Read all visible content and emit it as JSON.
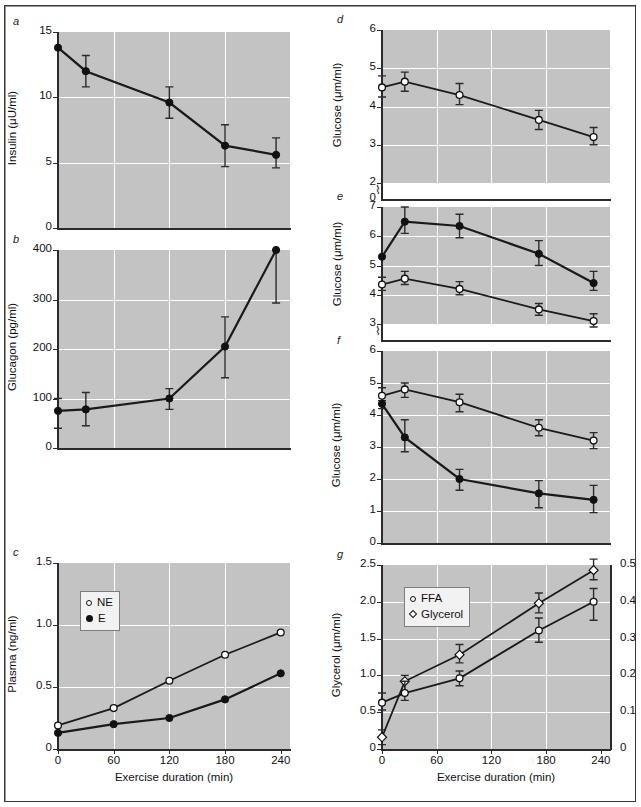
{
  "figure": {
    "xlabel": "Exercise duration (min)",
    "xticks": [
      "0",
      "60",
      "120",
      "180",
      "240"
    ],
    "panel_letters": [
      "a",
      "b",
      "c",
      "d",
      "e",
      "f",
      "g"
    ]
  },
  "chart_data": [
    {
      "panel": "a",
      "type": "line",
      "title": "",
      "xlabel": "",
      "ylabel": "Insulin (μU/ml)",
      "xlim": [
        0,
        250
      ],
      "ylim": [
        0,
        15
      ],
      "yticks": [
        0,
        5,
        10,
        15
      ],
      "ytick_labels": [
        "0",
        "5",
        "10",
        "15"
      ],
      "grid": true,
      "legend": null,
      "series": [
        {
          "name": "Insulin",
          "marker": "filled-circle",
          "x": [
            0,
            30,
            120,
            180,
            235
          ],
          "values": [
            13.8,
            12.0,
            9.6,
            6.3,
            5.6
          ],
          "err_low": [
            13.8,
            10.8,
            8.4,
            4.7,
            4.6
          ],
          "err_high": [
            13.8,
            13.2,
            10.8,
            7.9,
            6.9
          ]
        }
      ]
    },
    {
      "panel": "b",
      "type": "line",
      "title": "",
      "xlabel": "",
      "ylabel": "Glucagon (pg/ml)",
      "xlim": [
        0,
        250
      ],
      "ylim": [
        0,
        400
      ],
      "yticks": [
        0,
        100,
        200,
        300,
        400
      ],
      "ytick_labels": [
        "0",
        "100",
        "200",
        "300",
        "400"
      ],
      "grid": true,
      "legend": null,
      "series": [
        {
          "name": "Glucagon",
          "marker": "filled-circle",
          "x": [
            0,
            30,
            120,
            180,
            235
          ],
          "values": [
            75,
            78,
            100,
            205,
            400
          ],
          "err_low": [
            40,
            45,
            78,
            142,
            293
          ],
          "err_high": [
            100,
            112,
            120,
            265,
            400
          ]
        }
      ]
    },
    {
      "panel": "c",
      "type": "line",
      "title": "",
      "xlabel": "Exercise duration (min)",
      "ylabel": "Plasma (ng/ml)",
      "xlim": [
        0,
        250
      ],
      "ylim": [
        0,
        1.5
      ],
      "yticks": [
        0,
        0.5,
        1.0,
        1.5
      ],
      "ytick_labels": [
        "0",
        "0.5",
        "1.0",
        "1.5"
      ],
      "grid": true,
      "legend": {
        "position": "upper-left",
        "entries": [
          "NE",
          "E"
        ]
      },
      "series": [
        {
          "name": "NE",
          "marker": "open-circle",
          "x": [
            0,
            60,
            120,
            180,
            240
          ],
          "values": [
            0.19,
            0.33,
            0.55,
            0.76,
            0.94
          ]
        },
        {
          "name": "E",
          "marker": "filled-circle",
          "x": [
            0,
            60,
            120,
            180,
            240
          ],
          "values": [
            0.13,
            0.2,
            0.25,
            0.4,
            0.61
          ]
        }
      ]
    },
    {
      "panel": "d",
      "type": "line",
      "title": "",
      "xlabel": "",
      "ylabel": "Glucose (μm/ml)",
      "xlim": [
        0,
        250
      ],
      "ylim": [
        2,
        6
      ],
      "yticks": [
        2,
        3,
        4,
        5,
        6
      ],
      "ytick_labels": [
        "2",
        "3",
        "4",
        "5",
        "6"
      ],
      "axis_break": true,
      "zero_label": "0",
      "grid": true,
      "legend": null,
      "series": [
        {
          "name": "Glucose",
          "marker": "open-circle",
          "x": [
            0,
            25,
            85,
            172,
            232
          ],
          "values": [
            4.5,
            4.65,
            4.3,
            3.65,
            3.2
          ],
          "err_low": [
            4.25,
            4.4,
            4.05,
            3.4,
            3.0
          ],
          "err_high": [
            4.8,
            4.9,
            4.6,
            3.9,
            3.45
          ]
        }
      ]
    },
    {
      "panel": "e",
      "type": "line",
      "title": "",
      "xlabel": "",
      "ylabel": "Glucose (μm/ml)",
      "xlim": [
        0,
        250
      ],
      "ylim": [
        3,
        7
      ],
      "yticks": [
        3,
        4,
        5,
        6,
        7
      ],
      "ytick_labels": [
        "3",
        "4",
        "5",
        "6",
        "7"
      ],
      "axis_break": true,
      "grid": true,
      "legend": null,
      "series": [
        {
          "name": "Glucose-filled",
          "marker": "filled-circle",
          "x": [
            0,
            25,
            85,
            172,
            232
          ],
          "values": [
            5.3,
            6.5,
            6.35,
            5.4,
            4.4
          ],
          "err_low": [
            5.3,
            6.1,
            5.95,
            5.0,
            4.15
          ],
          "err_high": [
            5.3,
            7.0,
            6.75,
            5.85,
            4.8
          ]
        },
        {
          "name": "Glucose-open",
          "marker": "open-circle",
          "x": [
            0,
            25,
            85,
            172,
            232
          ],
          "values": [
            4.35,
            4.55,
            4.2,
            3.5,
            3.1
          ],
          "err_low": [
            4.15,
            4.35,
            4.0,
            3.3,
            2.9
          ],
          "err_high": [
            4.6,
            4.8,
            4.45,
            3.7,
            3.35
          ]
        }
      ]
    },
    {
      "panel": "f",
      "type": "line",
      "title": "",
      "xlabel": "",
      "ylabel": "Glucose (μm/ml)",
      "xlim": [
        0,
        250
      ],
      "ylim": [
        0,
        6
      ],
      "yticks": [
        0,
        1,
        2,
        3,
        4,
        5,
        6
      ],
      "ytick_labels": [
        "0",
        "1",
        "2",
        "3",
        "4",
        "5",
        "6"
      ],
      "grid": true,
      "legend": null,
      "series": [
        {
          "name": "Glucose-open",
          "marker": "open-circle",
          "x": [
            0,
            25,
            85,
            172,
            232
          ],
          "values": [
            4.6,
            4.8,
            4.4,
            3.6,
            3.2
          ],
          "err_low": [
            4.35,
            4.55,
            4.1,
            3.35,
            2.95
          ],
          "err_high": [
            4.85,
            5.0,
            4.65,
            3.85,
            3.45
          ]
        },
        {
          "name": "Glucose-filled",
          "marker": "filled-circle",
          "x": [
            0,
            25,
            85,
            172,
            232
          ],
          "values": [
            4.35,
            3.3,
            2.0,
            1.55,
            1.35
          ],
          "err_low": [
            4.2,
            2.85,
            1.65,
            1.1,
            0.95
          ],
          "err_high": [
            4.45,
            3.85,
            2.3,
            1.95,
            1.8
          ]
        }
      ]
    },
    {
      "panel": "g",
      "type": "line",
      "title": "",
      "xlabel": "Exercise duration (min)",
      "ylabel": "Glycerol (μm/ml)",
      "ylabel_right": "",
      "xlim": [
        0,
        250
      ],
      "ylim": [
        0,
        2.5
      ],
      "yticks": [
        0,
        0.5,
        1.0,
        1.5,
        2.0,
        2.5
      ],
      "ytick_labels": [
        "0",
        "0.5",
        "1.0",
        "1.5",
        "2.0",
        "2.5"
      ],
      "ylim_right": [
        0,
        0.5
      ],
      "ytick_labels_right": [
        "0",
        "0.1",
        "0.2",
        "0.3",
        "0.4",
        "0.5"
      ],
      "grid": true,
      "legend": {
        "position": "upper-left",
        "entries": [
          "FFA",
          "Glycerol"
        ]
      },
      "series": [
        {
          "name": "Glycerol",
          "marker": "open-diamond",
          "axis": "left",
          "x": [
            0,
            25,
            85,
            172,
            232
          ],
          "values": [
            0.16,
            0.92,
            1.28,
            1.98,
            2.43
          ],
          "err_low": [
            0.06,
            0.78,
            1.17,
            1.85,
            2.3
          ],
          "err_high": [
            0.26,
            1.0,
            1.42,
            2.12,
            2.58
          ]
        },
        {
          "name": "FFA",
          "marker": "open-circle",
          "axis": "left",
          "x": [
            0,
            25,
            85,
            172,
            232
          ],
          "values": [
            0.63,
            0.76,
            0.96,
            1.61,
            2.0
          ],
          "err_low": [
            0.53,
            0.66,
            0.86,
            1.45,
            1.75
          ],
          "err_high": [
            0.76,
            0.92,
            1.06,
            1.78,
            2.18
          ]
        }
      ]
    }
  ]
}
